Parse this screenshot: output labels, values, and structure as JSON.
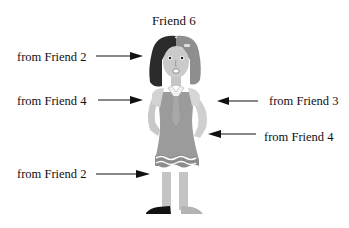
{
  "title": "Friend 6",
  "labels": [
    {
      "id": "hair-left",
      "text": "from Friend 2",
      "side": "left"
    },
    {
      "id": "body-left",
      "text": "from Friend 4",
      "side": "left"
    },
    {
      "id": "arm-right",
      "text": "from Friend 3",
      "side": "right"
    },
    {
      "id": "hand-right",
      "text": "from Friend 4",
      "side": "right"
    },
    {
      "id": "leg-left",
      "text": "from Friend 2",
      "side": "left"
    }
  ],
  "colors": {
    "hair_dark": "#2a2a2a",
    "hair_light": "#8a8a8a",
    "skin": "#c8c8c8",
    "dress": "#9a9a9a",
    "shoe_dark": "#111111",
    "shoe_light": "#b0b0b0"
  }
}
